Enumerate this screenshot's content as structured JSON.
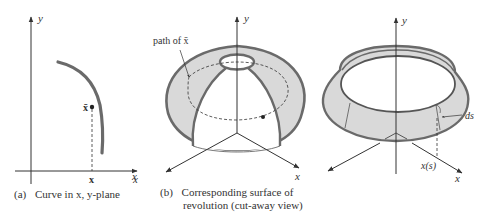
{
  "figure": {
    "panels": [
      {
        "id": "a",
        "caption_tag": "(a)",
        "caption_line1": "Curve in x, y-plane",
        "axis_x_label": "x",
        "axis_y_label": "y",
        "point_label": "x̄",
        "point_projection_label": "x"
      },
      {
        "id": "b",
        "caption_tag": "(b)",
        "caption_line1": "Corresponding surface of",
        "caption_line2": "revolution (cut-away view)",
        "axis_x_label": "x",
        "axis_x2_label": "x",
        "axis_y_label": "y",
        "annotation": "path of  x̄"
      },
      {
        "id": "c",
        "axis_x_label": "x",
        "axis_y_label": "y",
        "arc_label": "ds",
        "radius_label": "x(s)"
      }
    ],
    "colors": {
      "ink": "#333333",
      "curve": "#6a6a6a",
      "surface_fill": "#d9d9d9",
      "background": "#ffffff"
    }
  }
}
